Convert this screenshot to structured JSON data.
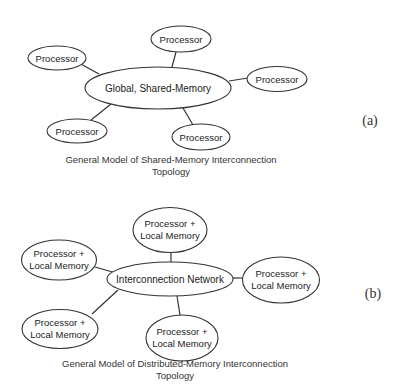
{
  "diagram_a": {
    "panel_label": "(a)",
    "center": {
      "label": "Global, Shared-Memory"
    },
    "nodes": [
      {
        "label": "Processor"
      },
      {
        "label": "Processor"
      },
      {
        "label": "Processor"
      },
      {
        "label": "Processor"
      },
      {
        "label": "Processor"
      }
    ],
    "caption": {
      "line1": "General Model of Shared-Memory Interconnection",
      "line2": "Topology"
    }
  },
  "diagram_b": {
    "panel_label": "(b)",
    "center": {
      "label": "Interconnection Network"
    },
    "nodes": [
      {
        "line1": "Processor +",
        "line2": "Local Memory"
      },
      {
        "line1": "Processor +",
        "line2": "Local Memory"
      },
      {
        "line1": "Processor +",
        "line2": "Local Memory"
      },
      {
        "line1": "Processor +",
        "line2": "Local Memory"
      },
      {
        "line1": "Processor +",
        "line2": "Local Memory"
      }
    ],
    "caption": {
      "line1": "General Model of Distributed-Memory Interconnection",
      "line2": "Topology"
    }
  }
}
